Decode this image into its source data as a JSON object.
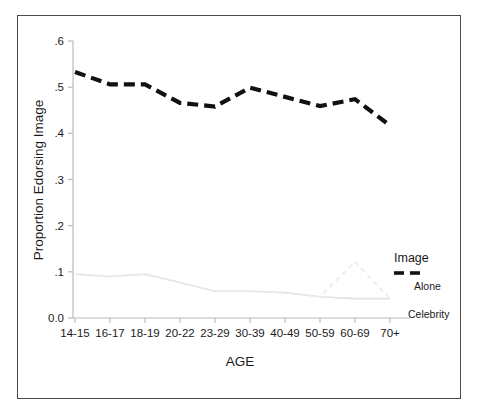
{
  "chart_data": {
    "type": "line",
    "title": "",
    "xlabel": "AGE",
    "ylabel": "Proportion Edorsing Image",
    "categories": [
      "14-15",
      "16-17",
      "18-19",
      "20-22",
      "23-29",
      "30-39",
      "40-49",
      "50-59",
      "60-69",
      "70+"
    ],
    "ylim": [
      0.0,
      0.6
    ],
    "yticks": [
      "0.0",
      ".1",
      ".2",
      ".3",
      ".4",
      ".5",
      ".6"
    ],
    "ytick_values": [
      0.0,
      0.1,
      0.2,
      0.3,
      0.4,
      0.5,
      0.6
    ],
    "grid": false,
    "legend_position": "right",
    "series": [
      {
        "name": "Image",
        "style": "dashed-bold",
        "color": "#111111",
        "values": [
          0.533,
          0.506,
          0.506,
          0.466,
          0.458,
          0.499,
          0.479,
          0.459,
          0.474,
          0.417
        ]
      },
      {
        "name": "Alone",
        "style": "solid-light",
        "color": "#e2e2e2",
        "values": [
          0.095,
          0.09,
          0.095,
          0.077,
          0.058,
          0.058,
          0.055,
          0.046,
          0.042,
          0.042
        ]
      },
      {
        "name": "Celebrity",
        "style": "dashed-light",
        "color": "#ebebeb",
        "values": [
          0.095,
          0.09,
          0.095,
          0.077,
          0.058,
          0.058,
          0.055,
          0.046,
          0.122,
          0.042
        ]
      }
    ]
  },
  "legend": {
    "image_label": "Image",
    "alone_label": "Alone",
    "celebrity_label": "Celebrity"
  },
  "colors": {
    "border": "#4a4a4a",
    "axis": "#bbbbbb",
    "image_series": "#111111",
    "alone_series": "#e2e2e2",
    "celebrity_series": "#ebebeb",
    "text": "#1a1a1a",
    "background": "#ffffff"
  }
}
